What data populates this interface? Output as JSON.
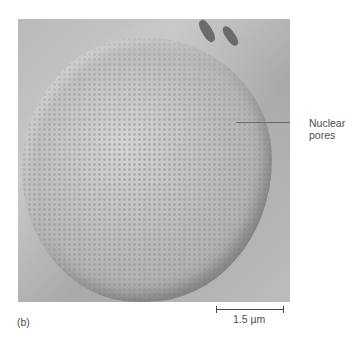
{
  "figure": {
    "panel_label": "(b)",
    "annotation": {
      "line1": "Nuclear",
      "line2": "pores"
    },
    "scale_bar": {
      "label": "1.5 µm"
    }
  }
}
